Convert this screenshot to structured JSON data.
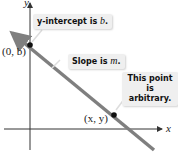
{
  "diagram": {
    "axes": {
      "x_label": "x",
      "y_label": "y"
    },
    "points": [
      {
        "label": "(0, b)",
        "coord_name": "y-intercept"
      },
      {
        "label": "(x, y)",
        "coord_name": "arbitrary point"
      }
    ],
    "callouts": {
      "intercept": {
        "text": "y-intercept is ",
        "var": "b",
        "end": "."
      },
      "slope": {
        "text": "Slope is ",
        "var": "m",
        "end": "."
      },
      "arbitrary": {
        "line1": "This point",
        "line2": "is arbitrary."
      }
    },
    "colors": {
      "line": "#7f7f7f",
      "axis": "#333333",
      "point": "#111111",
      "callout_bg": "#efefef"
    }
  }
}
